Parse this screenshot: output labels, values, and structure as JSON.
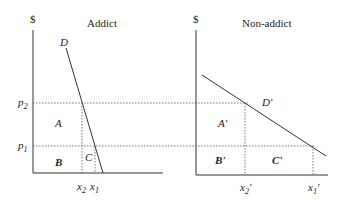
{
  "left_panel": {
    "title": "Addict",
    "y_axis_label": "$",
    "curve_label": "D",
    "price_labels": [
      "p2",
      "p1"
    ],
    "quantity_labels": [
      "x2",
      "x1"
    ],
    "regions": [
      "A",
      "B",
      "C"
    ]
  },
  "right_panel": {
    "title": "Non-addict",
    "y_axis_label": "$",
    "curve_label": "D'",
    "quantity_labels": [
      "x2'",
      "x1'"
    ],
    "regions": [
      "A'",
      "B'",
      "C'"
    ]
  },
  "colors": {
    "line": "#333333",
    "dotted": "#555555",
    "background": "#ffffff"
  }
}
